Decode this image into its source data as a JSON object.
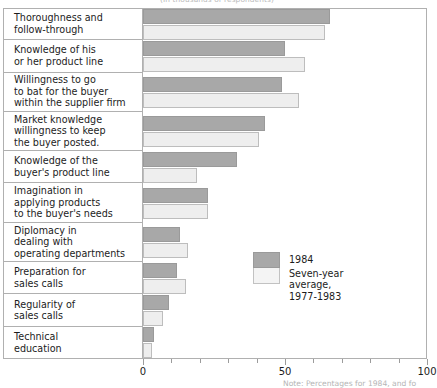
{
  "chart_data": {
    "type": "bar",
    "orientation": "horizontal",
    "title": "",
    "subtitle": "(In thousands of respondents)",
    "note": "Note: Percentages for 1984, and fo",
    "xlabel": "",
    "ylabel": "",
    "xlim": [
      0,
      100
    ],
    "xticks": [
      0,
      10,
      20,
      30,
      40,
      50,
      60,
      70,
      80,
      90,
      100
    ],
    "xtick_labels": [
      "0",
      "",
      "",
      "",
      "",
      "50",
      "",
      "",
      "",
      "",
      "100"
    ],
    "grid": false,
    "legend_position": "center-right",
    "categories": [
      "Thoroughness and\n   follow-through",
      "Knowledge of his\n   or her product line",
      "Willingness to go\n   to bat for the buyer\n   within the supplier firm",
      "Market knowledge\n   willingness to keep\n   the buyer posted.",
      "Knowledge of the\n   buyer's product line",
      "Imagination in\n   applying products\n   to the buyer's needs",
      "Diplomacy in\n   dealing with\n   operating departments",
      "Preparation for\n   sales calls",
      "Regularity of\n   sales calls",
      "Technical\n   education"
    ],
    "series": [
      {
        "name": "1984",
        "color": "#a8a8a8",
        "values": [
          66,
          50,
          49,
          43,
          33,
          23,
          13,
          12,
          9,
          4
        ]
      },
      {
        "name": "Seven-year average,\n1977-1983",
        "color": "#eeeeee",
        "values": [
          64,
          57,
          55,
          41,
          19,
          23,
          16,
          15,
          7,
          3
        ]
      }
    ]
  },
  "legend": {
    "entries": [
      {
        "label": "1984"
      },
      {
        "label": "Seven-year average,\n1977-1983"
      }
    ]
  }
}
